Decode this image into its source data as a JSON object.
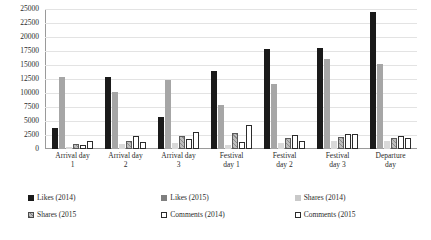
{
  "chart_data": {
    "type": "bar",
    "title": "",
    "xlabel": "",
    "ylabel": "",
    "ylim": [
      0,
      25000
    ],
    "ytick_step": 2500,
    "grid": true,
    "legend_position": "bottom",
    "yticks": [
      "25000",
      "22500",
      "20000",
      "17500",
      "15000",
      "12500",
      "10000",
      "7500",
      "5000",
      "2500",
      "0"
    ],
    "categories": [
      "Arrival day 1",
      "Arrival day 2",
      "Arrival day 3",
      "Festival day 1",
      "Festival day 2",
      "Festival day 3",
      "Departure day"
    ],
    "category_lines": [
      [
        "Arrival day",
        "1"
      ],
      [
        "Arrival day",
        "2"
      ],
      [
        "Arrival day",
        "3"
      ],
      [
        "Festival",
        "day 1"
      ],
      [
        "Festival",
        "day 2"
      ],
      [
        "Festival",
        "day 3"
      ],
      [
        "Departure",
        "day"
      ]
    ],
    "series": [
      {
        "name": "Likes (2014)",
        "color": "#1a1a1a",
        "values": [
          3800,
          12800,
          5800,
          13900,
          17800,
          18100,
          24500
        ]
      },
      {
        "name": "Likes (2015)",
        "color": "#a6a6a6",
        "values": [
          12900,
          10100,
          12300,
          7900,
          11600,
          16100,
          15100
        ]
      },
      {
        "name": "Shares (2014)",
        "color": "#d9d9d9",
        "values": [
          400,
          900,
          1000,
          700,
          1100,
          1400,
          1500
        ]
      },
      {
        "name": "Shares (2015",
        "color": "#bdbdbd",
        "values": [
          900,
          1500,
          2400,
          2900,
          1900,
          2100,
          2000
        ]
      },
      {
        "name": "Comments (2014)",
        "color": "#ffffff",
        "values": [
          700,
          2300,
          1700,
          1300,
          2500,
          2600,
          2300
        ]
      },
      {
        "name": "Comments (2015",
        "color": "#ffffff",
        "values": [
          1500,
          1300,
          3100,
          4300,
          1500,
          2600,
          1900
        ]
      }
    ]
  },
  "legend": {
    "items": [
      {
        "label": "Likes (2014)",
        "swatch": "lg-likes14"
      },
      {
        "label": "Likes (2015)",
        "swatch": "lg-likes15"
      },
      {
        "label": "Shares (2014)",
        "swatch": "lg-shares14"
      },
      {
        "label": "Shares (2015",
        "swatch": "lg-shares15"
      },
      {
        "label": "Comments (2014)",
        "swatch": "lg-comments14"
      },
      {
        "label": "Comments (2015",
        "swatch": "lg-comments15"
      }
    ]
  }
}
